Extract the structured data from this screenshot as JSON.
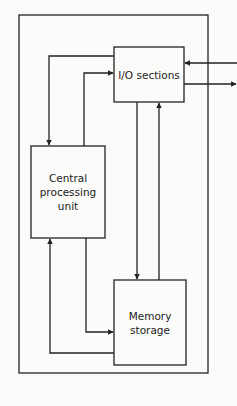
{
  "diagram": {
    "type": "block-diagram",
    "colors": {
      "line": "#222222",
      "background": "#fbfbf9",
      "text": "#222222"
    },
    "nodes": [
      {
        "id": "io",
        "label": "I/O sections"
      },
      {
        "id": "cpu",
        "label": "Central processing unit",
        "lines": [
          "Central",
          "processing",
          "unit"
        ]
      },
      {
        "id": "memory",
        "label": "Memory storage",
        "lines": [
          "Memory",
          "storage"
        ]
      }
    ],
    "edges": [
      {
        "from": "io",
        "to": "cpu"
      },
      {
        "from": "cpu",
        "to": "io"
      },
      {
        "from": "io",
        "to": "memory"
      },
      {
        "from": "memory",
        "to": "io"
      },
      {
        "from": "cpu",
        "to": "memory"
      },
      {
        "from": "memory",
        "to": "cpu"
      },
      {
        "from": "external",
        "to": "io"
      },
      {
        "from": "io",
        "to": "external"
      }
    ]
  },
  "labels": {
    "io": "I/O sections",
    "cpu_line1": "Central",
    "cpu_line2": "processing",
    "cpu_line3": "unit",
    "mem_line1": "Memory",
    "mem_line2": "storage"
  }
}
